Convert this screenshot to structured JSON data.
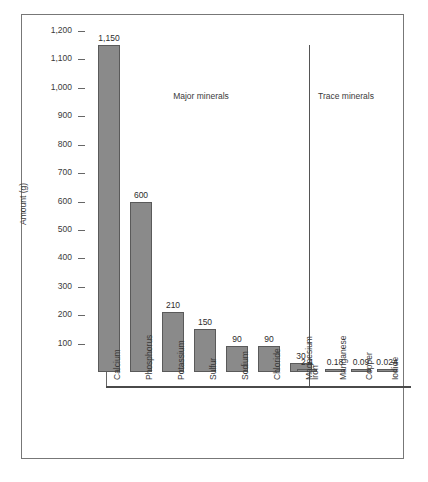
{
  "chart_data": {
    "type": "bar",
    "title": "",
    "xlabel": "",
    "ylabel": "Amount (g)",
    "ylim": [
      0,
      1200
    ],
    "ytick_labels": [
      "1,200",
      "1,100",
      "1,000",
      "900",
      "800",
      "700",
      "600",
      "500",
      "400",
      "300",
      "200",
      "100"
    ],
    "ytick_values": [
      1200,
      1100,
      1000,
      900,
      800,
      700,
      600,
      500,
      400,
      300,
      200,
      100
    ],
    "grid": false,
    "legend": "none",
    "categories": [
      "Calcium",
      "Phosphorus",
      "Potassium",
      "Sulfur",
      "Sodium",
      "Chloride",
      "Magnesium",
      "Iron",
      "Manganese",
      "Copper",
      "Iodide"
    ],
    "values": [
      1150,
      600,
      210,
      150,
      90,
      90,
      30,
      2.4,
      0.18,
      0.09,
      0.024
    ],
    "value_labels": [
      "1,150",
      "600",
      "210",
      "150",
      "90",
      "90",
      "30",
      "2.4",
      "0.18",
      "0.09",
      "0.024"
    ],
    "annotations": [
      {
        "text": "Major minerals",
        "group": "major"
      },
      {
        "text": "Trace minerals",
        "group": "trace"
      }
    ],
    "groups": {
      "major": {
        "label": "Major minerals",
        "categories": [
          "Calcium",
          "Phosphorus",
          "Potassium",
          "Sulfur",
          "Sodium",
          "Chloride",
          "Magnesium"
        ]
      },
      "trace": {
        "label": "Trace minerals",
        "categories": [
          "Iron",
          "Manganese",
          "Copper",
          "Iodide"
        ]
      }
    },
    "colors": {
      "bar_fill": "#8a8a8a",
      "bar_stroke": "#5a5a5a",
      "axis": "#666666",
      "text": "#3a3a3a"
    }
  }
}
